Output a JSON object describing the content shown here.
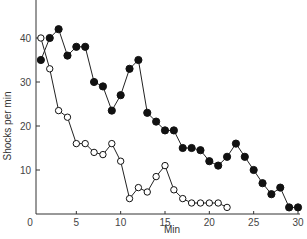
{
  "chart_data": {
    "type": "line",
    "title": "",
    "xlabel": "Min",
    "ylabel": "Shocks per min",
    "xlim": [
      0,
      30
    ],
    "ylim": [
      0,
      45
    ],
    "xticks": [
      0,
      5,
      10,
      15,
      20,
      25,
      30
    ],
    "yticks": [
      10,
      20,
      30,
      40
    ],
    "grid": false,
    "legend": null,
    "series": [
      {
        "name": "filled circles",
        "marker": "filled-circle",
        "x": [
          1,
          2,
          3,
          4,
          5,
          6,
          7,
          8,
          9,
          10,
          11,
          12,
          13,
          14,
          15,
          16,
          17,
          18,
          19,
          20,
          21,
          22,
          23,
          24,
          25,
          26,
          27,
          28,
          29,
          30
        ],
        "values": [
          35,
          40,
          42,
          36,
          38,
          38,
          30,
          29,
          23.5,
          27,
          33,
          35,
          23,
          21,
          19,
          19,
          15,
          15,
          14.5,
          12,
          11,
          13,
          16,
          13,
          10,
          7,
          4.5,
          6,
          1.5,
          1.5
        ]
      },
      {
        "name": "open circles",
        "marker": "open-circle",
        "x": [
          1,
          2,
          3,
          4,
          5,
          6,
          7,
          8,
          9,
          10,
          11,
          12,
          13,
          14,
          15,
          16,
          17,
          18,
          19,
          20,
          21,
          22
        ],
        "values": [
          40,
          33,
          23.5,
          22,
          16,
          16,
          14,
          13.5,
          16,
          12,
          3.5,
          6,
          5,
          8.5,
          11,
          5.5,
          3.5,
          2.5,
          2.5,
          2.5,
          2.5,
          1.5
        ]
      }
    ]
  }
}
